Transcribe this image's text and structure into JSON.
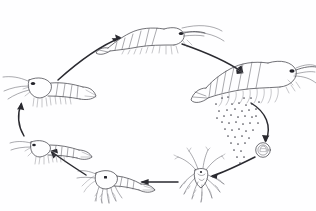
{
  "figure": {
    "title": "Shrimp (penaeid prawn) life cycle",
    "style": "pen-and-ink line drawing",
    "background_color": "#fefeff",
    "ink_color": "#3b3b42",
    "arrow_color": "#2a2a30",
    "cycle_direction": "clockwise",
    "has_text_labels": false,
    "has_border": false,
    "width": 316,
    "height": 211
  },
  "stages": [
    {
      "id": "adult-spawning-female",
      "name": "adult-female-shrimp-spawning",
      "label": "",
      "position": "right",
      "orientation": "facing-right",
      "description": "Large adult shrimp releasing a cloud of eggs from beneath the abdomen",
      "cx": 258,
      "cy": 78
    },
    {
      "id": "egg",
      "name": "fertilized-egg",
      "label": "",
      "position": "lower-right",
      "orientation": "none",
      "description": "Single fertilized egg drawn as concentric circles with embryo inside",
      "cx": 263,
      "cy": 150
    },
    {
      "id": "nauplius",
      "name": "nauplius-larva",
      "label": "",
      "position": "bottom-center",
      "orientation": "spread",
      "description": "Nauplius larva with radiating feathery setae",
      "cx": 200,
      "cy": 178
    },
    {
      "id": "zoea-mysis",
      "name": "mysis-larva",
      "label": "",
      "position": "bottom-left-center",
      "orientation": "facing-left",
      "description": "Mysis / zoea stage larva with elongated body and thoracic appendages",
      "cx": 103,
      "cy": 180
    },
    {
      "id": "postlarva",
      "name": "postlarva",
      "label": "",
      "position": "left-lower",
      "orientation": "facing-left",
      "description": "Postlarva resembling a miniature shrimp",
      "cx": 44,
      "cy": 146
    },
    {
      "id": "juvenile",
      "name": "juvenile-shrimp",
      "label": "",
      "position": "left-upper",
      "orientation": "facing-left",
      "description": "Juvenile shrimp with developed rostrum and pleopods",
      "cx": 46,
      "cy": 86
    },
    {
      "id": "subadult",
      "name": "subadult-shrimp",
      "label": "",
      "position": "top-center",
      "orientation": "facing-right",
      "description": "Sub-adult shrimp migrating, body arched",
      "cx": 143,
      "cy": 37
    }
  ],
  "arrows": [
    {
      "id": "a1",
      "name": "arrow-subadult-to-adult",
      "from": "subadult",
      "to": "adult-spawning-female",
      "shape": "curved",
      "direction": "right-down"
    },
    {
      "id": "a2",
      "name": "arrow-adult-to-egg",
      "from": "adult-spawning-female",
      "to": "egg",
      "shape": "curved",
      "direction": "down"
    },
    {
      "id": "a3",
      "name": "arrow-egg-to-nauplius",
      "from": "egg",
      "to": "nauplius",
      "shape": "curved",
      "direction": "left-down"
    },
    {
      "id": "a4",
      "name": "arrow-nauplius-to-mysis",
      "from": "nauplius",
      "to": "zoea-mysis",
      "shape": "straight",
      "direction": "left"
    },
    {
      "id": "a5",
      "name": "arrow-mysis-to-postlarva",
      "from": "zoea-mysis",
      "to": "postlarva",
      "shape": "curved",
      "direction": "left-up"
    },
    {
      "id": "a6",
      "name": "arrow-postlarva-to-juvenile",
      "from": "postlarva",
      "to": "juvenile",
      "shape": "curved",
      "direction": "up"
    },
    {
      "id": "a7",
      "name": "arrow-juvenile-to-subadult",
      "from": "juvenile",
      "to": "subadult",
      "shape": "curved",
      "direction": "right-up"
    }
  ],
  "egg_cloud": {
    "name": "released-egg-cloud",
    "count": 46,
    "color": "#4a4a52",
    "description": "Scattered dots falling from the spawning female"
  }
}
